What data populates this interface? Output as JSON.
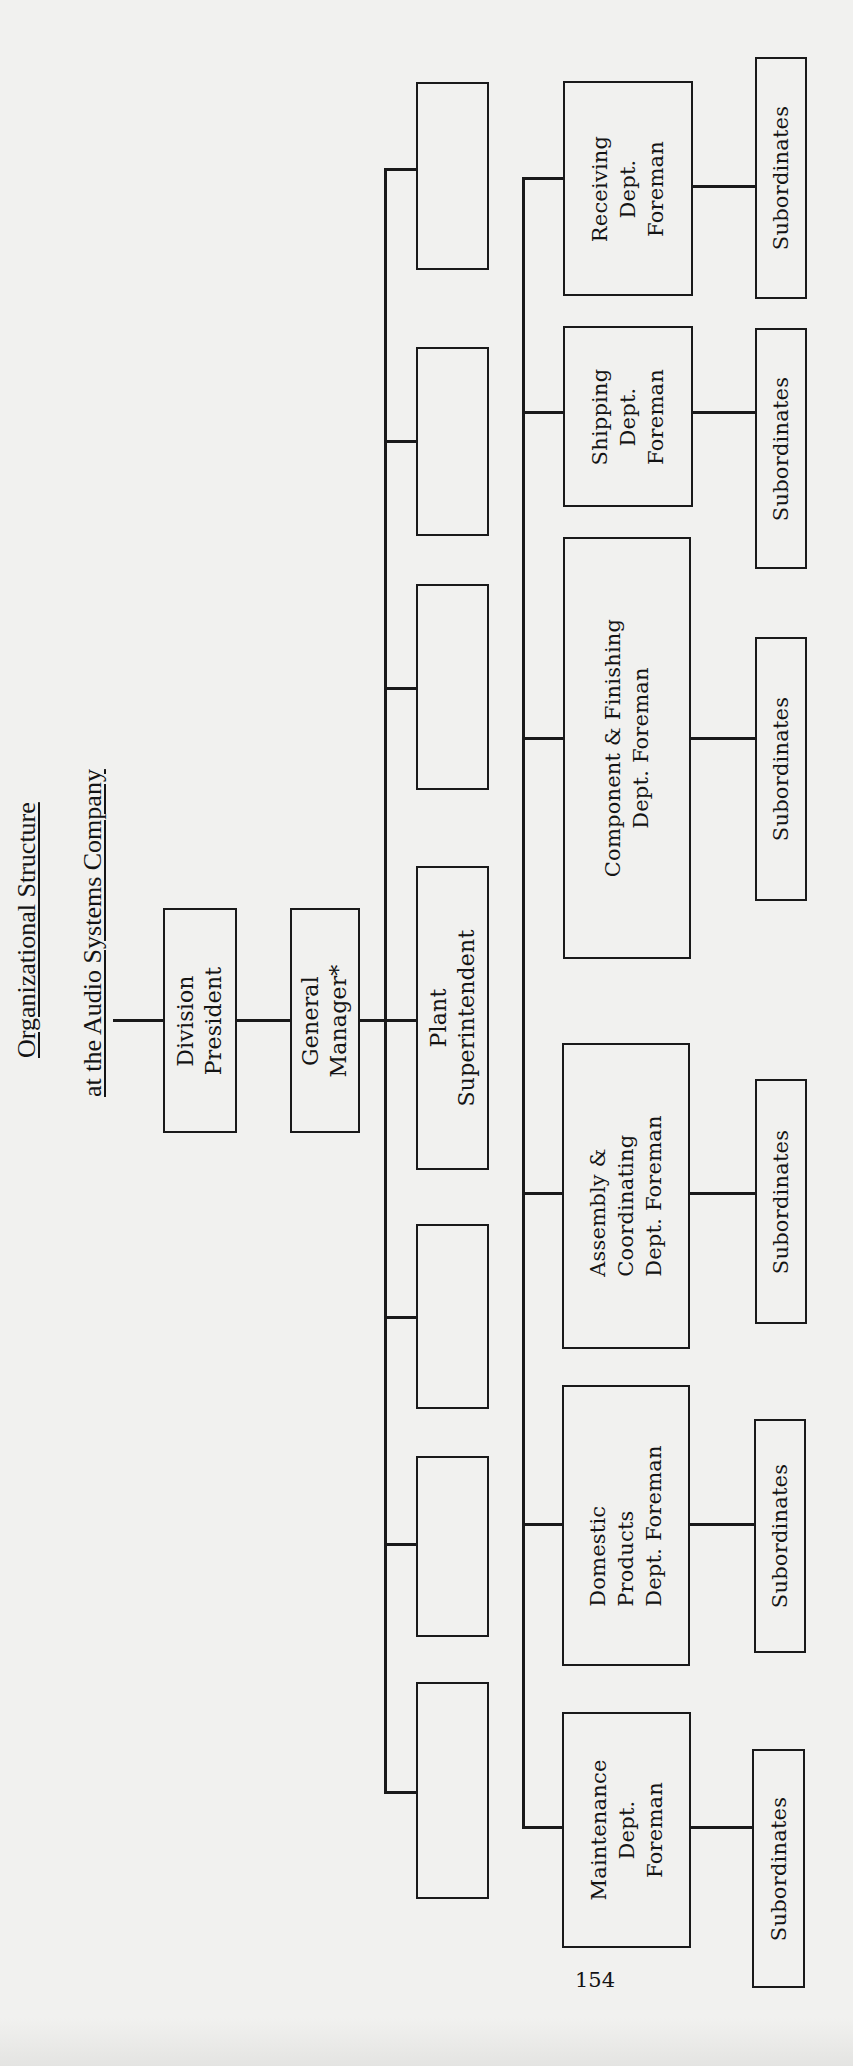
{
  "title": {
    "line1": "Organizational Structure",
    "line2": "at the Audio Systems Company"
  },
  "executives": {
    "division_president": [
      "Division",
      "President"
    ],
    "general_manager": [
      "General",
      "Manager*"
    ],
    "plant_superintendent": [
      "Plant",
      "Superintendent"
    ]
  },
  "unlabeled_positions_count": 6,
  "foremen": [
    {
      "lines": [
        "Receiving",
        "Dept.",
        "Foreman"
      ]
    },
    {
      "lines": [
        "Shipping",
        "Dept.",
        "Foreman"
      ]
    },
    {
      "lines": [
        "Component & Finishing",
        "Dept. Foreman"
      ]
    },
    {
      "lines": [
        "Assembly &",
        "Coordinating",
        "Dept. Foreman"
      ]
    },
    {
      "lines": [
        "Domestic",
        "Products",
        "Dept. Foreman"
      ]
    },
    {
      "lines": [
        "Maintenance",
        "Dept.",
        "Foreman"
      ]
    }
  ],
  "subordinates_label": "Subordinates",
  "page_number": "154",
  "colors": {
    "paper": "#f1f1ef",
    "ink": "#1a1a1a"
  }
}
